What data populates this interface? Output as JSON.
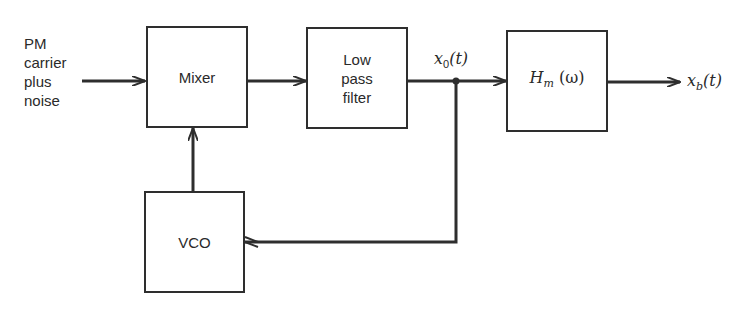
{
  "diagram": {
    "input_label": [
      "PM",
      "carrier",
      "plus",
      "noise"
    ],
    "blocks": {
      "mixer": "Mixer",
      "lpf": [
        "Low",
        "pass",
        "filter"
      ],
      "hm": {
        "main": "H",
        "sub": "m",
        "arg": "(ω)"
      },
      "vco": "VCO"
    },
    "signals": {
      "x0": {
        "main": "x",
        "sub": "0",
        "arg": "(t)"
      },
      "xb": {
        "main": "x",
        "sub": "b",
        "arg": "(t)"
      }
    }
  }
}
